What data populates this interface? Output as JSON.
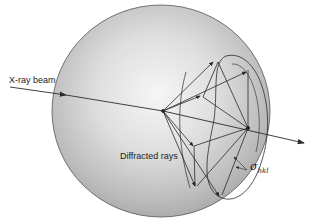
{
  "diagram": {
    "labels": {
      "beam": "X-ray beam",
      "diffracted": "Diffracted rays",
      "sigma_symbol": "σ",
      "sigma_subscript": "hkl"
    },
    "colors": {
      "sphere_light": "#f4f4f4",
      "sphere_dark": "#a9a9a9",
      "line": "#2a2a2a",
      "background": "#ffffff"
    }
  }
}
